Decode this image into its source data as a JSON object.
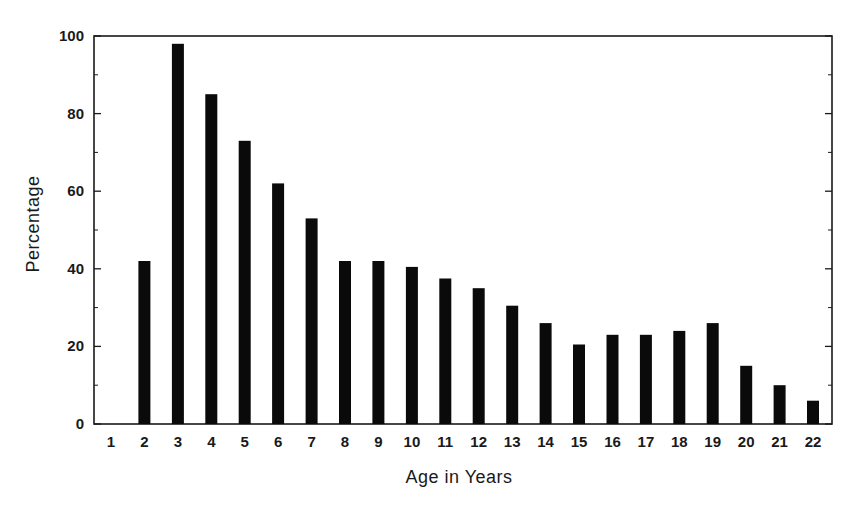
{
  "chart_data": {
    "type": "bar",
    "title": "",
    "xlabel": "Age in Years",
    "ylabel": "Percentage",
    "categories": [
      "1",
      "2",
      "3",
      "4",
      "5",
      "6",
      "7",
      "8",
      "9",
      "10",
      "11",
      "12",
      "13",
      "14",
      "15",
      "16",
      "17",
      "18",
      "19",
      "20",
      "21",
      "22"
    ],
    "values": [
      0,
      42,
      98,
      85,
      73,
      62,
      53,
      42,
      42,
      40.5,
      37.5,
      35,
      30.5,
      26,
      20.5,
      23,
      23,
      24,
      26,
      15,
      10,
      6
    ],
    "ylim": [
      0,
      100
    ],
    "yticks": [
      0,
      20,
      40,
      60,
      80,
      100
    ],
    "yticks_minor": [
      10,
      30,
      50,
      70,
      90
    ],
    "grid": false,
    "legend": "none",
    "bar_color": "#0a0a0a",
    "axis_color": "#1a1a1a"
  }
}
